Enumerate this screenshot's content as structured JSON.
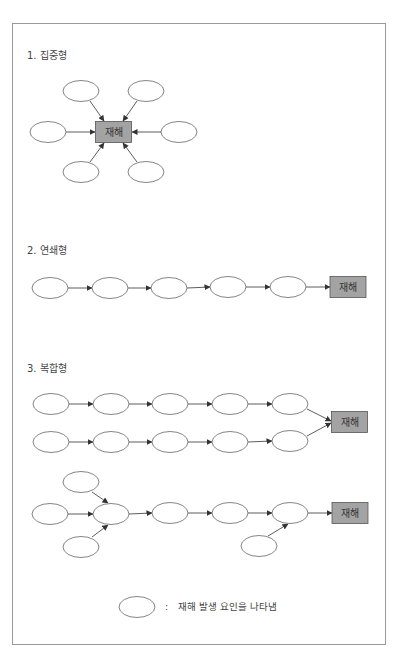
{
  "colors": {
    "node_stroke": "#666666",
    "node_fill": "#ffffff",
    "disaster_fill": "#a3a3a3",
    "disaster_stroke": "#555555",
    "arrow": "#333333",
    "text": "#444444",
    "frame": "#9a9a9a"
  },
  "sections": [
    {
      "id": "concentrated",
      "heading": "1. 집중형",
      "heading_y": 50
    },
    {
      "id": "chain",
      "heading": "2. 연쇄형",
      "heading_y": 245
    },
    {
      "id": "compound",
      "heading": "3. 복합형",
      "heading_y": 363
    }
  ],
  "disaster_label": "재해",
  "legend": {
    "colon": ":",
    "text": "재해 발생 요인을 나타냄"
  },
  "geometry": {
    "ellipse_rx": 18,
    "ellipse_ry": 10.5,
    "box_w": 36,
    "box_h": 21,
    "boxes": [
      {
        "id": "box-concentrated",
        "cx": 113.5,
        "cy": 132
      },
      {
        "id": "box-chain",
        "cx": 348,
        "cy": 287
      },
      {
        "id": "box-compound-1",
        "cx": 349.5,
        "cy": 422
      },
      {
        "id": "box-compound-2",
        "cx": 350,
        "cy": 513
      }
    ],
    "ellipses": [
      {
        "id": "c-top-left",
        "cx": 81,
        "cy": 91
      },
      {
        "id": "c-top-right",
        "cx": 146,
        "cy": 91
      },
      {
        "id": "c-left",
        "cx": 48,
        "cy": 132
      },
      {
        "id": "c-right",
        "cx": 179,
        "cy": 132
      },
      {
        "id": "c-bottom-left",
        "cx": 81,
        "cy": 172
      },
      {
        "id": "c-bottom-right",
        "cx": 146,
        "cy": 172
      },
      {
        "id": "ch-1",
        "cx": 50,
        "cy": 288
      },
      {
        "id": "ch-2",
        "cx": 110,
        "cy": 288
      },
      {
        "id": "ch-3",
        "cx": 169,
        "cy": 288
      },
      {
        "id": "ch-4",
        "cx": 228,
        "cy": 287
      },
      {
        "id": "ch-5",
        "cx": 288,
        "cy": 287
      },
      {
        "id": "a-1",
        "cx": 51,
        "cy": 404
      },
      {
        "id": "a-2",
        "cx": 111,
        "cy": 404
      },
      {
        "id": "a-3",
        "cx": 170,
        "cy": 404
      },
      {
        "id": "a-4",
        "cx": 230,
        "cy": 404
      },
      {
        "id": "a-5",
        "cx": 290,
        "cy": 404
      },
      {
        "id": "b-1",
        "cx": 51,
        "cy": 442
      },
      {
        "id": "b-2",
        "cx": 111,
        "cy": 442
      },
      {
        "id": "b-3",
        "cx": 170,
        "cy": 442
      },
      {
        "id": "b-4",
        "cx": 230,
        "cy": 442
      },
      {
        "id": "b-5",
        "cx": 290,
        "cy": 441
      },
      {
        "id": "m-top",
        "cx": 81,
        "cy": 482
      },
      {
        "id": "m-left",
        "cx": 50,
        "cy": 514
      },
      {
        "id": "m-hub",
        "cx": 111,
        "cy": 514
      },
      {
        "id": "m-bottom",
        "cx": 81,
        "cy": 547
      },
      {
        "id": "m-3",
        "cx": 170,
        "cy": 513
      },
      {
        "id": "m-4",
        "cx": 230,
        "cy": 513
      },
      {
        "id": "m-5",
        "cx": 290,
        "cy": 513
      },
      {
        "id": "m-5-bottom",
        "cx": 259,
        "cy": 546
      },
      {
        "id": "legend-ellipse",
        "cx": 137,
        "cy": 607
      }
    ],
    "arrows": [
      {
        "x1": 90,
        "y1": 101,
        "x2": 104,
        "y2": 121
      },
      {
        "x1": 137,
        "y1": 101,
        "x2": 123,
        "y2": 121
      },
      {
        "x1": 66,
        "y1": 132,
        "x2": 95,
        "y2": 132
      },
      {
        "x1": 161,
        "y1": 132,
        "x2": 132,
        "y2": 132
      },
      {
        "x1": 90,
        "y1": 162,
        "x2": 104,
        "y2": 143
      },
      {
        "x1": 137,
        "y1": 162,
        "x2": 123,
        "y2": 143
      },
      {
        "x1": 68,
        "y1": 288,
        "x2": 92,
        "y2": 288
      },
      {
        "x1": 128,
        "y1": 288,
        "x2": 151,
        "y2": 288
      },
      {
        "x1": 187,
        "y1": 288,
        "x2": 210,
        "y2": 287
      },
      {
        "x1": 246,
        "y1": 287,
        "x2": 270,
        "y2": 287
      },
      {
        "x1": 306,
        "y1": 287,
        "x2": 330,
        "y2": 287
      },
      {
        "x1": 69,
        "y1": 404,
        "x2": 93,
        "y2": 404
      },
      {
        "x1": 129,
        "y1": 404,
        "x2": 152,
        "y2": 404
      },
      {
        "x1": 188,
        "y1": 404,
        "x2": 212,
        "y2": 404
      },
      {
        "x1": 248,
        "y1": 404,
        "x2": 272,
        "y2": 404
      },
      {
        "x1": 307,
        "y1": 409,
        "x2": 331,
        "y2": 421
      },
      {
        "x1": 69,
        "y1": 442,
        "x2": 93,
        "y2": 442
      },
      {
        "x1": 129,
        "y1": 442,
        "x2": 152,
        "y2": 442
      },
      {
        "x1": 188,
        "y1": 442,
        "x2": 212,
        "y2": 442
      },
      {
        "x1": 248,
        "y1": 442,
        "x2": 272,
        "y2": 441
      },
      {
        "x1": 307,
        "y1": 436,
        "x2": 331,
        "y2": 423
      },
      {
        "x1": 92,
        "y1": 492,
        "x2": 108,
        "y2": 503
      },
      {
        "x1": 68,
        "y1": 514,
        "x2": 93,
        "y2": 514
      },
      {
        "x1": 92,
        "y1": 537,
        "x2": 108,
        "y2": 525
      },
      {
        "x1": 129,
        "y1": 514,
        "x2": 152,
        "y2": 513
      },
      {
        "x1": 188,
        "y1": 513,
        "x2": 212,
        "y2": 513
      },
      {
        "x1": 248,
        "y1": 513,
        "x2": 272,
        "y2": 513
      },
      {
        "x1": 268,
        "y1": 536,
        "x2": 288,
        "y2": 524
      },
      {
        "x1": 308,
        "y1": 513,
        "x2": 332,
        "y2": 513
      }
    ]
  }
}
